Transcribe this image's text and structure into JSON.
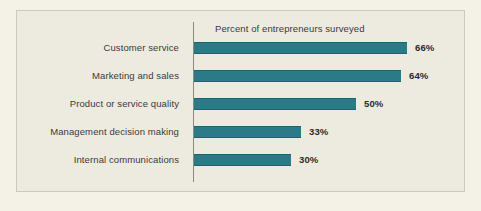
{
  "figure": {
    "background_color": "#f4f1e6",
    "panel_color": "#edeae0",
    "panel_border_color": "#cdcabd",
    "axis_color": "#8d8b80",
    "text_color": "#3a3a3a"
  },
  "chart_data": {
    "type": "bar",
    "orientation": "horizontal",
    "title": "Percent of entrepreneurs surveyed",
    "xlabel": "",
    "ylabel": "",
    "xlim": [
      0,
      70
    ],
    "grid": false,
    "legend": null,
    "bar_color": "#2b7a88",
    "value_suffix": "%",
    "categories": [
      "Customer service",
      "Marketing and sales",
      "Product or service quality",
      "Management decision making",
      "Internal communications"
    ],
    "values": [
      66,
      64,
      50,
      33,
      30
    ],
    "value_labels": [
      "66%",
      "64%",
      "50%",
      "33%",
      "30%"
    ]
  }
}
